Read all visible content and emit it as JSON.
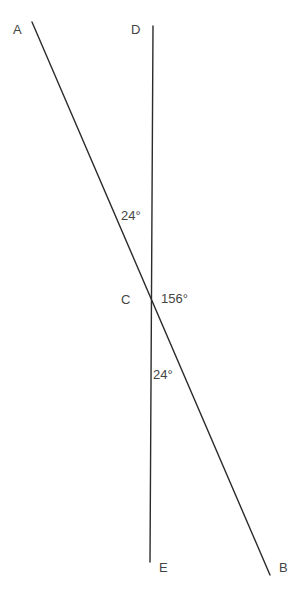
{
  "diagram": {
    "background_color": "#ffffff",
    "stroke_color": "#2b2b2b",
    "text_color": "#444444",
    "stroke_width": 1.4,
    "points": {
      "A": {
        "label": "A",
        "x": 32,
        "y": 22
      },
      "B": {
        "label": "B",
        "x": 270,
        "y": 575
      },
      "C": {
        "label": "C",
        "x": 152,
        "y": 300
      },
      "D": {
        "label": "D",
        "x": 153,
        "y": 26
      },
      "E": {
        "label": "E",
        "x": 150,
        "y": 562
      }
    },
    "lines": [
      {
        "name": "line-AB",
        "from": "A",
        "to": "B",
        "x1": 32,
        "y1": 22,
        "x2": 270,
        "y2": 575
      },
      {
        "name": "line-DE",
        "from": "D",
        "to": "E",
        "x1": 153,
        "y1": 26,
        "x2": 150,
        "y2": 562
      }
    ],
    "angles": [
      {
        "name": "angle-ACD",
        "value": "24°",
        "position": "upper-left-of-intersection"
      },
      {
        "name": "angle-DCB",
        "value": "156°",
        "position": "right-of-intersection"
      },
      {
        "name": "angle-BCE",
        "value": "24°",
        "position": "lower-right-of-intersection"
      }
    ]
  }
}
